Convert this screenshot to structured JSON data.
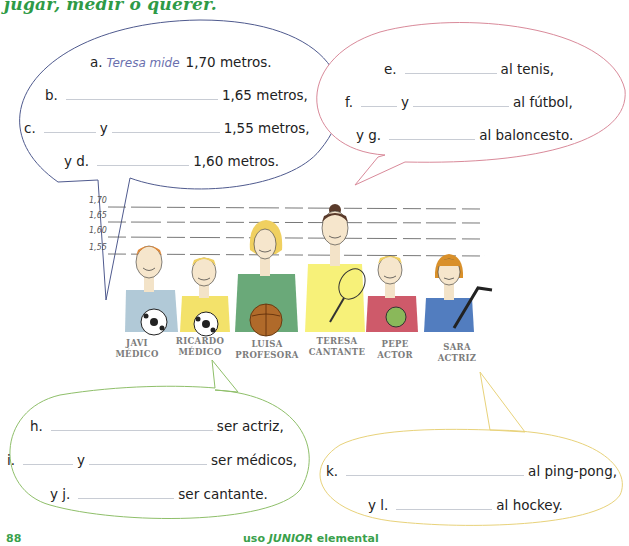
{
  "header": {
    "title": "jugar, medir o querer."
  },
  "bubble_heights": {
    "lines": [
      {
        "label": "a.",
        "hint": "Teresa mide",
        "suffix": "1,70 metros."
      },
      {
        "label": "b.",
        "suffix": "1,65 metros,"
      },
      {
        "label": "c.",
        "connector": "y",
        "suffix": "1,55 metros,"
      },
      {
        "label": "y d.",
        "suffix": "1,60 metros."
      }
    ]
  },
  "bubble_sports_top": {
    "lines": [
      {
        "label": "e.",
        "suffix": "al tenis,"
      },
      {
        "label": "f.",
        "connector": "y",
        "suffix": "al fútbol,"
      },
      {
        "label": "y g.",
        "suffix": "al baloncesto."
      }
    ]
  },
  "illustration": {
    "scale_marks": [
      "1,70",
      "1,65",
      "1,60",
      "1,55"
    ],
    "people": [
      {
        "name": "JAVI",
        "job": "MÉDICO",
        "shirt": "#a9c3d3",
        "hair": "#e08a3a",
        "item": "soccer-ball"
      },
      {
        "name": "RICARDO",
        "job": "MÉDICO",
        "shirt": "#f2df5a",
        "hair": "#f0d060",
        "item": "soccer-ball"
      },
      {
        "name": "LUISA",
        "job": "PROFESORA",
        "shirt": "#5aa06a",
        "hair": "#f0d060",
        "item": "basketball"
      },
      {
        "name": "TERESA",
        "job": "CANTANTE",
        "shirt": "#f6ef6a",
        "hair": "#5a3a2a",
        "item": "tennis-racket"
      },
      {
        "name": "PEPE",
        "job": "ACTOR",
        "shirt": "#c9485a",
        "hair": "#f0d060",
        "item": "ping-pong-paddle"
      },
      {
        "name": "SARA",
        "job": "ACTRIZ",
        "shirt": "#3f6fb8",
        "hair": "#d9902a",
        "item": "hockey-stick"
      }
    ]
  },
  "bubble_professions": {
    "lines": [
      {
        "label": "h.",
        "suffix": "ser actriz,"
      },
      {
        "label": "i.",
        "connector": "y",
        "suffix": "ser médicos,"
      },
      {
        "label": "y j.",
        "suffix": "ser cantante."
      }
    ]
  },
  "bubble_sports_bottom": {
    "lines": [
      {
        "label": "k.",
        "suffix": "al ping-pong,"
      },
      {
        "label": "y l.",
        "suffix": "al hockey."
      }
    ]
  },
  "footer": {
    "page_number": "88",
    "book_prefix": "uso ",
    "book_series": "JUNIOR",
    "book_suffix": " elemental"
  },
  "colors": {
    "accent_green": "#2e9a46",
    "bubble_blue": "#4f5a8e",
    "bubble_pink": "#d98a9a",
    "bubble_green": "#8fbf6a",
    "bubble_yellow": "#e8d27a"
  }
}
